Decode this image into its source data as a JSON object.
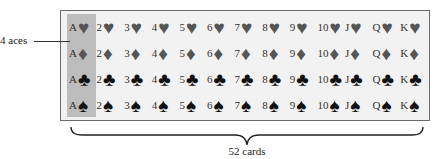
{
  "annotations": {
    "aces_label": "4 aces",
    "total_label": "52 cards"
  },
  "colors": {
    "box_background": "#f2f2f2",
    "ace_highlight": "#bdbdbd",
    "red_suit_render": "#555555",
    "black_suit_render": "#111111"
  },
  "deck": {
    "ranks": [
      "A",
      "2",
      "3",
      "4",
      "5",
      "6",
      "7",
      "8",
      "9",
      "10",
      "J",
      "Q",
      "K"
    ],
    "suits": [
      {
        "name": "hearts",
        "glyph": "♥",
        "color": "red"
      },
      {
        "name": "diamonds",
        "glyph": "♦",
        "color": "red"
      },
      {
        "name": "clubs",
        "glyph": "♣",
        "color": "black"
      },
      {
        "name": "spades",
        "glyph": "♠",
        "color": "black"
      }
    ],
    "highlighted_rank": "A"
  }
}
